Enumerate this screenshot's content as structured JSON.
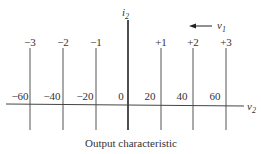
{
  "diagram": {
    "y_axis_label": "i",
    "y_axis_sub": "2",
    "x_axis_label": "v",
    "x_axis_sub": "2",
    "arrow_label": "v",
    "arrow_sub": "1",
    "caption": "Output characteristic",
    "v1_levels": [
      "−3",
      "−2",
      "−1",
      "+1",
      "+2",
      "+3"
    ],
    "v2_ticks": [
      "−60",
      "−40",
      "−20",
      "0",
      "20",
      "40",
      "60"
    ]
  }
}
